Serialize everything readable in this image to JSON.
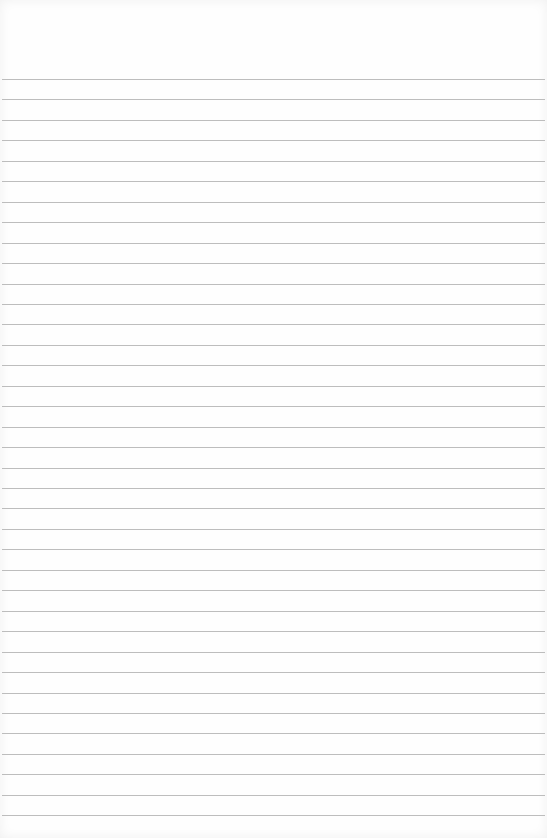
{
  "paper": {
    "type": "ruled notebook paper",
    "background_color": "#fefefe",
    "line_color": "#bdbdbd",
    "first_line_y": 79,
    "line_spacing": 20.45,
    "line_count": 37
  }
}
